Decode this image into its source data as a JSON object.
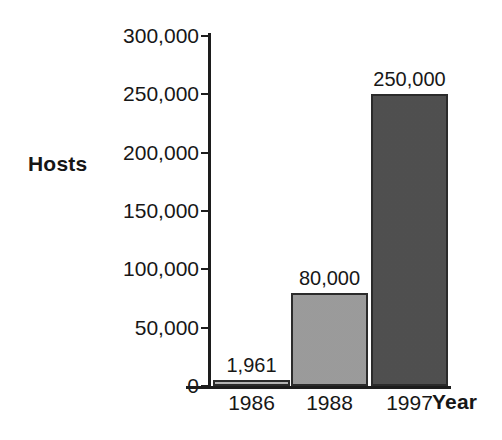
{
  "chart_data": {
    "type": "bar",
    "title": "",
    "xlabel": "Year",
    "ylabel": "Hosts",
    "categories": [
      "1986",
      "1988",
      "1997"
    ],
    "values": [
      1961,
      80000,
      250000
    ],
    "value_labels": [
      "1,961",
      "80,000",
      "250,000"
    ],
    "bar_colors": [
      "#b6b6b6",
      "#9b9b9b",
      "#4c4c4c"
    ],
    "bar_border_color": "#2b2b2b",
    "ylim": [
      0,
      300000
    ],
    "yticks": [
      0,
      50000,
      100000,
      150000,
      200000,
      250000,
      300000
    ],
    "ytick_labels": [
      "0",
      "50,000",
      "100,000",
      "150,000",
      "200,000",
      "250,000",
      "300,000"
    ],
    "grid": false,
    "legend": null,
    "axis_color": "#1d1d1d",
    "background_color": "#ffffff"
  },
  "axes": {
    "y_title": "Hosts",
    "x_title": "Year"
  }
}
